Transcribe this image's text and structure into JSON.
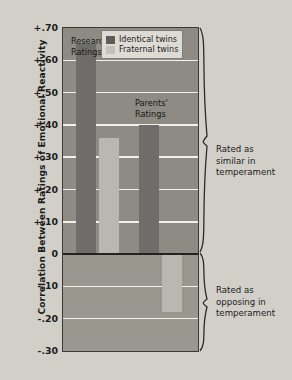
{
  "chart_data": {
    "type": "bar",
    "title": "",
    "xlabel": "",
    "ylabel": "Correlation Between Ratings of Emotional Reactivity",
    "ylim": [
      -0.3,
      0.7
    ],
    "ytick_step": 0.1,
    "ytick_labels": [
      "+.70",
      "+.60",
      "+.50",
      "+.40",
      "+.30",
      "+.20",
      "+.10",
      "0",
      "-.10",
      "-.20",
      "-.30"
    ],
    "ytick_values": [
      0.7,
      0.6,
      0.5,
      0.4,
      0.3,
      0.2,
      0.1,
      0.0,
      -0.1,
      -0.2,
      -0.3
    ],
    "grid": true,
    "legend_position": "top-right",
    "categories": [
      "Researchers' Ratings",
      "Parents' Ratings"
    ],
    "series": [
      {
        "name": "Identical twins",
        "color": "#6f6d69",
        "values": [
          0.65,
          0.4
        ]
      },
      {
        "name": "Fraternal twins",
        "color": "#b9b7b1",
        "values": [
          0.36,
          -0.18
        ]
      }
    ],
    "annotations": [
      {
        "text": "Rated as similar in temperament",
        "region": "positive"
      },
      {
        "text": "Rated as opposing in temperament",
        "region": "negative"
      }
    ]
  },
  "legend": {
    "items": [
      {
        "label": "Identical twins"
      },
      {
        "label": "Fraternal twins"
      }
    ]
  },
  "axis": {
    "y_title": "Correlation Between Ratings of Emotional Reactivity",
    "ticks": [
      "+.70",
      "+.60",
      "+.50",
      "+.40",
      "+.30",
      "+.20",
      "+.10",
      "0",
      "-.10",
      "-.20",
      "-.30"
    ]
  },
  "category_labels": {
    "researchers_line1": "Researchers'",
    "researchers_line2": "Ratings",
    "parents_line1": "Parents'",
    "parents_line2": "Ratings"
  },
  "annotations": {
    "similar": {
      "line1": "Rated as",
      "line2": "similar in",
      "line3": "temperament"
    },
    "opposing": {
      "line1": "Rated as",
      "line2": "opposing in",
      "line3": "temperament"
    }
  }
}
